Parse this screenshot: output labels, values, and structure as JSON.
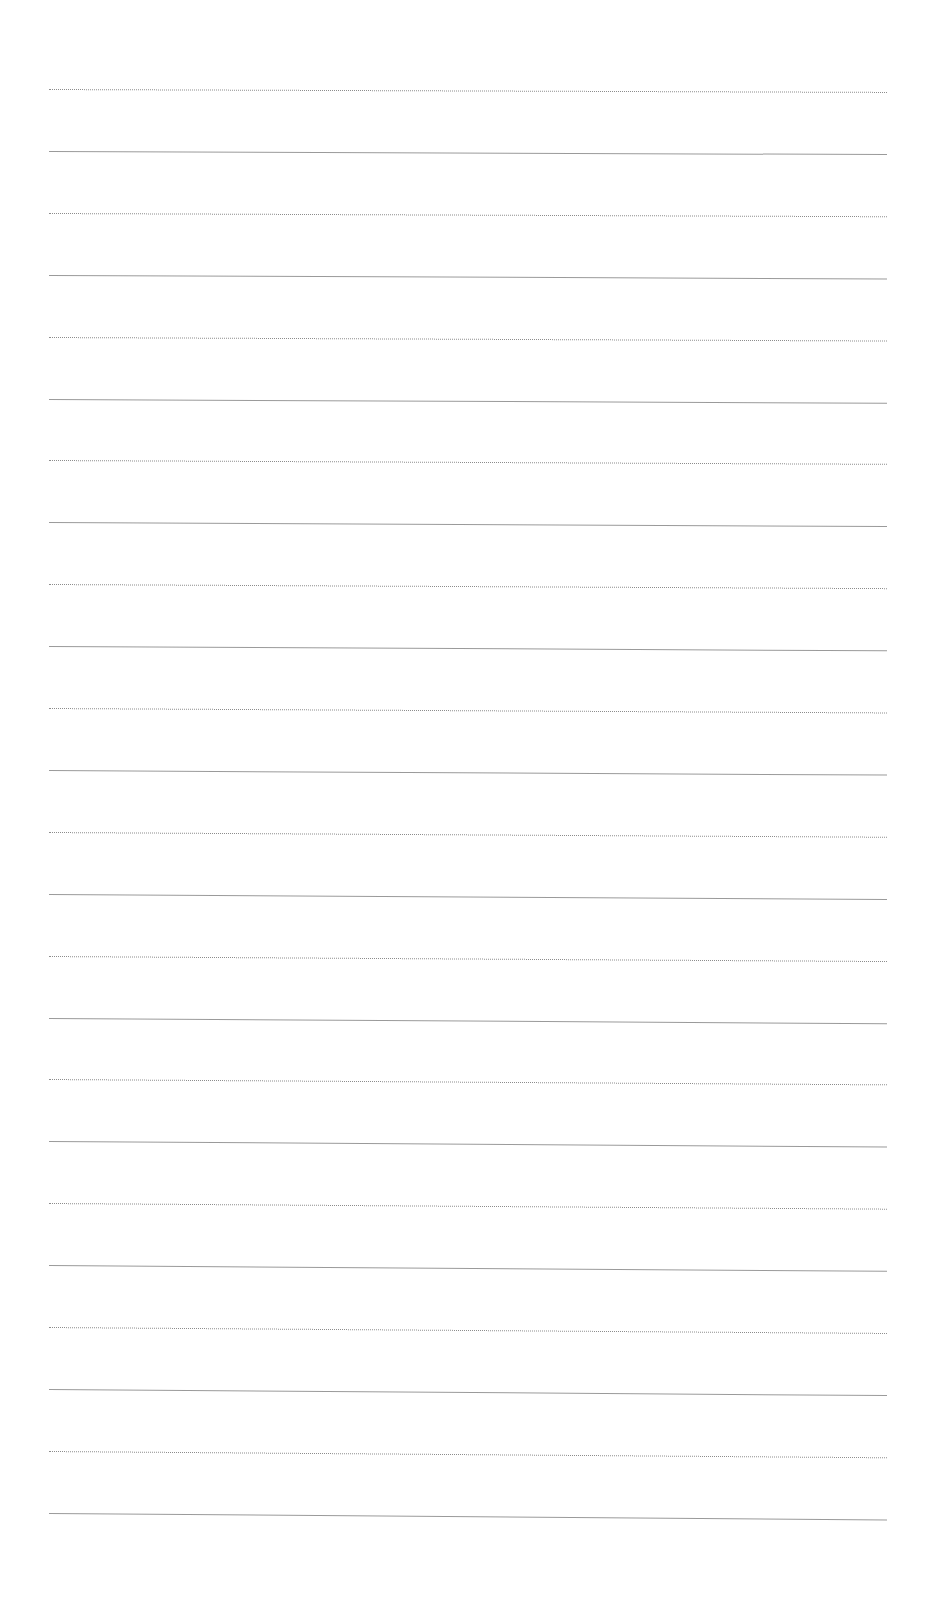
{
  "document": {
    "type": "ruled-paper",
    "background_color": "#ffffff",
    "line_color": "#9a9a9a",
    "line_count": 24,
    "first_line_y": 89,
    "line_spacing": 61.9,
    "line_left": 49,
    "line_right": 887,
    "content_text": ""
  }
}
